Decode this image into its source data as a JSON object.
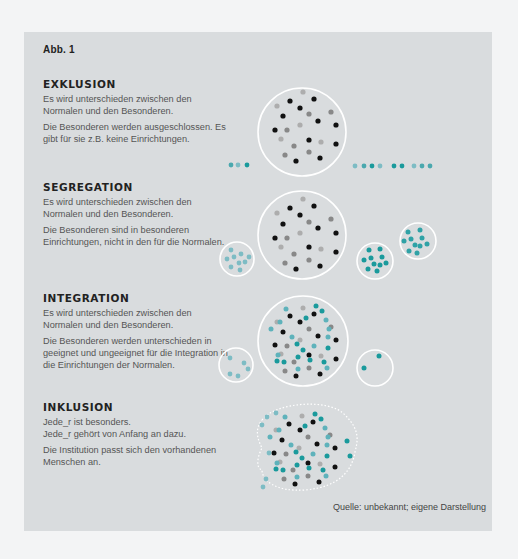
{
  "figure_label": "Abb. 1",
  "sections": [
    {
      "title": "EXKLUSION",
      "paragraphs": [
        "Es wird unterschieden zwischen den Normalen und den Besonderen.",
        "Die Besonderen werden ausgeschlossen. Es gibt für sie z.B. keine Einrichtungen."
      ]
    },
    {
      "title": "SEGREGATION",
      "paragraphs": [
        "Es wird unterschieden zwischen den Normalen und den Besonderen.",
        "Die Besonderen sind in besonderen Einrichtungen, nicht in den für die Normalen."
      ]
    },
    {
      "title": "INTEGRATION",
      "paragraphs": [
        "Es wird unterschieden zwischen den Normalen und den Besonderen.",
        "Die Besonderen werden unterschieden in geeignet und ungeeignet für die Integration in die Einrichtungen der Normalen."
      ]
    },
    {
      "title": "INKLUSION",
      "paragraphs": [
        "Jede_r ist besonders.\nJede_r gehört von Anfang an dazu.",
        "Die Institution passt sich den vorhandenen Menschen an."
      ]
    }
  ],
  "source": "Quelle: unbekannt; eigene Darstellung",
  "colors": {
    "panel_bg": "#d9dcde",
    "circle_stroke": "#ffffff",
    "black": "#111111",
    "gray": "#8a8a8a",
    "lightgray": "#a9a9a9",
    "teal": "#1a9a9c",
    "lightteal": "#6fb7c4"
  }
}
